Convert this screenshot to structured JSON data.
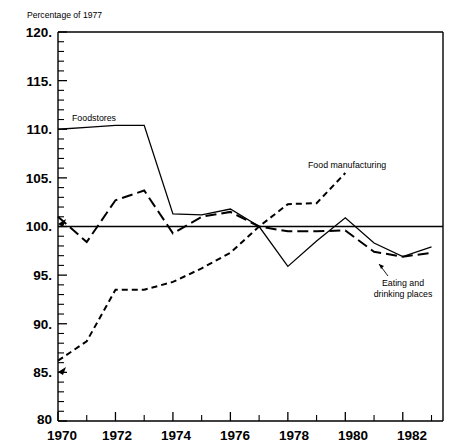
{
  "chart_data": {
    "type": "line",
    "title": "Percentage of 1977",
    "xlabel": "",
    "ylabel": "",
    "xlim": [
      1970,
      1983.4
    ],
    "ylim": [
      80,
      120
    ],
    "ytick_labels": [
      "120.",
      "115.",
      "110.",
      "105.",
      "100.",
      "95.",
      "90.",
      "85.",
      "80"
    ],
    "ytick_values": [
      120,
      115,
      110,
      105,
      100,
      95,
      90,
      85,
      80
    ],
    "ytick_minor_step": 1,
    "xtick_values": [
      1970,
      1971,
      1972,
      1973,
      1974,
      1975,
      1976,
      1977,
      1978,
      1979,
      1980,
      1981,
      1982,
      1983
    ],
    "xtick_labels_shown": [
      "1970",
      "1972",
      "1974",
      "1976",
      "1978",
      "1980",
      "1982"
    ],
    "xtick_label_values": [
      1970,
      1972,
      1974,
      1976,
      1978,
      1980,
      1982
    ],
    "grid": false,
    "legend_position": "inline-annotations",
    "reference_line": {
      "value": 100,
      "label": "100 baseline"
    },
    "series": [
      {
        "name": "Foodstores",
        "style": "solid",
        "dash": "none",
        "color": "#000000",
        "x": [
          1970,
          1971,
          1972,
          1973,
          1974,
          1975,
          1976,
          1977,
          1978,
          1979,
          1980,
          1981,
          1982,
          1983
        ],
        "values": [
          110.0,
          110.2,
          110.4,
          110.4,
          101.3,
          101.2,
          101.8,
          100.0,
          95.9,
          98.5,
          100.9,
          98.3,
          96.9,
          97.9
        ]
      },
      {
        "name": "Food manufacturing",
        "style": "short-dash",
        "dash": "6,4",
        "color": "#000000",
        "x": [
          1970,
          1971,
          1972,
          1973,
          1974,
          1975,
          1976,
          1977,
          1978,
          1979,
          1980
        ],
        "values": [
          86.2,
          88.2,
          93.5,
          93.5,
          94.3,
          95.7,
          97.3,
          100.0,
          102.3,
          102.4,
          105.5
        ]
      },
      {
        "name": "Eating and drinking places",
        "style": "long-dash",
        "dash": "11,5",
        "color": "#000000",
        "x": [
          1970,
          1971,
          1972,
          1973,
          1974,
          1975,
          1976,
          1977,
          1978,
          1979,
          1980,
          1981,
          1982,
          1983
        ],
        "values": [
          101.0,
          98.4,
          102.7,
          103.7,
          99.3,
          101.0,
          101.5,
          100.0,
          99.5,
          99.5,
          99.6,
          97.4,
          96.9,
          97.3
        ]
      }
    ],
    "annotations": [
      {
        "text": "Foodstores",
        "series": "Foodstores"
      },
      {
        "text": "Food manufacturing",
        "series": "Food manufacturing"
      },
      {
        "text": "Eating and",
        "series": "Eating and drinking places"
      },
      {
        "text": "drinking places",
        "series": "Eating and drinking places"
      }
    ]
  },
  "labels": {
    "title": "Percentage of 1977",
    "foodstores": "Foodstores",
    "food_manufacturing": "Food manufacturing",
    "eating_line1": "Eating and",
    "eating_line2": "drinking places",
    "y_120": "120.",
    "y_115": "115.",
    "y_110": "110.",
    "y_105": "105.",
    "y_100": "100.",
    "y_95": "95.",
    "y_90": "90.",
    "y_85": "85.",
    "y_80": "80",
    "x_1970": "1970",
    "x_1972": "1972",
    "x_1974": "1974",
    "x_1976": "1976",
    "x_1978": "1978",
    "x_1980": "1980",
    "x_1982": "1982"
  }
}
